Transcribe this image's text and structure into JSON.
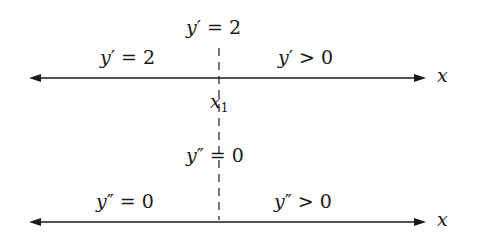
{
  "diagram": {
    "colors": {
      "line": "#1a1a1a",
      "background": "#ffffff"
    },
    "top_line": {
      "axis_label": "x",
      "critical_label": "x1",
      "center_label": "y' = 2",
      "left_label": "y' = 2",
      "right_label": "y' > 0"
    },
    "bottom_line": {
      "axis_label": "x",
      "center_label": "y'' = 0",
      "left_label": "y'' = 0",
      "right_label": "y'' > 0"
    }
  }
}
